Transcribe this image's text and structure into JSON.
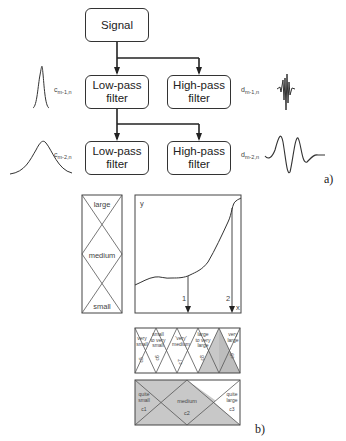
{
  "part_a": {
    "label": "a)",
    "signal_box": "Signal",
    "level1": {
      "low_pass": "Low-pass\nfilter",
      "high_pass": "High-pass\nfilter",
      "approx_coef": "c",
      "approx_sub": "m-1,n",
      "detail_coef": "d",
      "detail_sub": "m-1,n"
    },
    "level2": {
      "low_pass": "Low-pass\nfilter",
      "high_pass": "High-pass\nfilter",
      "approx_coef": "c",
      "approx_sub": "m-2,n",
      "detail_coef": "d",
      "detail_sub": "m-2,n"
    }
  },
  "part_b": {
    "label": "b)",
    "scale_box": {
      "labels": [
        "large",
        "medium",
        "small"
      ]
    },
    "graph": {
      "y_axis": "y",
      "x_axis": "x",
      "markers": [
        "1",
        "2"
      ]
    },
    "fine_scale": {
      "segments": [
        {
          "label": "very\nsmall",
          "id": "c5"
        },
        {
          "label": "small\nto very\nsmall",
          "id": "c6"
        },
        {
          "label": "'very'\nmedium",
          "id": "c7"
        },
        {
          "label": "large\nto very\nlarge",
          "id": "c8"
        },
        {
          "label": "very\nlarge",
          "id": "c9"
        }
      ]
    },
    "coarse_scale": {
      "segments": [
        {
          "label": "quite\nsmall",
          "id": "c1"
        },
        {
          "label": "medium",
          "id": "c2"
        },
        {
          "label": "quite\nlarge",
          "id": "c3"
        }
      ]
    },
    "colors": {
      "shade": "#c8c8c8",
      "line": "#333333"
    }
  }
}
